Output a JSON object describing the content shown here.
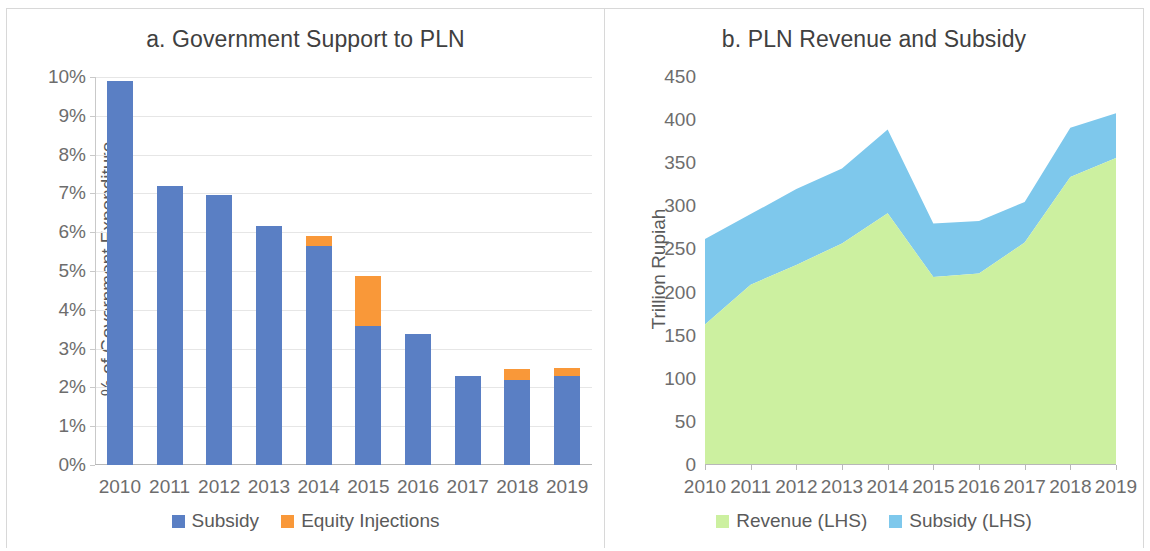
{
  "figure": {
    "background": "#ffffff",
    "border_color": "#d8d8d8"
  },
  "panel_a": {
    "title": "a. Government Support to PLN",
    "ylabel": "% of Government Expenditure",
    "ytick_labels": [
      "0%",
      "1%",
      "2%",
      "3%",
      "4%",
      "5%",
      "6%",
      "7%",
      "8%",
      "9%",
      "10%"
    ],
    "xtick_labels": [
      "2010",
      "2011",
      "2012",
      "2013",
      "2014",
      "2015",
      "2016",
      "2017",
      "2018",
      "2019"
    ],
    "legend": [
      {
        "label": "Subsidy",
        "color": "#5a7fc4"
      },
      {
        "label": "Equity Injections",
        "color": "#f99839"
      }
    ]
  },
  "panel_b": {
    "title": "b. PLN Revenue and Subsidy",
    "ylabel": "Trillion Rupiah",
    "ytick_labels": [
      "0",
      "50",
      "100",
      "150",
      "200",
      "250",
      "300",
      "350",
      "400",
      "450"
    ],
    "xtick_labels": [
      "2010",
      "2011",
      "2012",
      "2013",
      "2014",
      "2015",
      "2016",
      "2017",
      "2018",
      "2019"
    ],
    "legend": [
      {
        "label": "Revenue (LHS)",
        "color": "#ccf0a0"
      },
      {
        "label": "Subsidy (LHS)",
        "color": "#7ec8ec"
      }
    ]
  },
  "chart_data": [
    {
      "id": "panel_a",
      "type": "bar",
      "stacked": true,
      "title": "a. Government Support to PLN",
      "xlabel": "",
      "ylabel": "% of Government Expenditure",
      "categories": [
        "2010",
        "2011",
        "2012",
        "2013",
        "2014",
        "2015",
        "2016",
        "2017",
        "2018",
        "2019"
      ],
      "series": [
        {
          "name": "Subsidy",
          "color": "#5a7fc4",
          "values": [
            9.9,
            7.2,
            6.95,
            6.15,
            5.65,
            3.58,
            3.37,
            2.3,
            2.2,
            2.3
          ]
        },
        {
          "name": "Equity Injections",
          "color": "#f99839",
          "values": [
            0,
            0,
            0,
            0,
            0.25,
            1.3,
            0,
            0,
            0.27,
            0.2
          ]
        }
      ],
      "totals": [
        9.9,
        7.2,
        6.95,
        6.15,
        5.9,
        4.88,
        3.37,
        2.3,
        2.47,
        2.5
      ],
      "ylim": [
        0,
        10
      ],
      "ytick_values": [
        0,
        1,
        2,
        3,
        4,
        5,
        6,
        7,
        8,
        9,
        10
      ],
      "ytick_format": "percent",
      "grid": true,
      "legend_position": "bottom"
    },
    {
      "id": "panel_b",
      "type": "area",
      "stacked": true,
      "title": "b. PLN Revenue and Subsidy",
      "xlabel": "",
      "ylabel": "Trillion Rupiah",
      "x": [
        "2010",
        "2011",
        "2012",
        "2013",
        "2014",
        "2015",
        "2016",
        "2017",
        "2018",
        "2019"
      ],
      "series": [
        {
          "name": "Revenue (LHS)",
          "color": "#ccf0a0",
          "values": [
            163,
            209,
            232,
            257,
            292,
            218,
            222,
            258,
            334,
            356
          ]
        },
        {
          "name": "Subsidy (LHS)",
          "color": "#7ec8ec",
          "values": [
            99,
            82,
            88,
            87,
            97,
            62,
            61,
            47,
            57,
            52
          ]
        }
      ],
      "totals": [
        262,
        291,
        320,
        344,
        389,
        280,
        283,
        305,
        391,
        408
      ],
      "ylim": [
        0,
        450
      ],
      "ytick_values": [
        0,
        50,
        100,
        150,
        200,
        250,
        300,
        350,
        400,
        450
      ],
      "grid": false,
      "legend_position": "bottom"
    }
  ]
}
